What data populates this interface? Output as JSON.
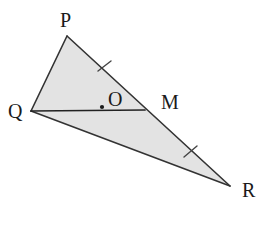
{
  "figure": {
    "kind": "geometry-diagram",
    "background_color": "#ffffff",
    "fill_color": "#e3e3e3",
    "stroke_color": "#333333",
    "label_color": "#1a1a1a",
    "canvas": {
      "width": 278,
      "height": 227
    }
  },
  "labels": {
    "p": "P",
    "q": "Q",
    "r": "R",
    "m": "M",
    "o": "O"
  },
  "points": {
    "P": {
      "x": 67,
      "y": 36
    },
    "Q": {
      "x": 31,
      "y": 111
    },
    "R": {
      "x": 230,
      "y": 186
    },
    "M": {
      "x": 145,
      "y": 110
    },
    "O": {
      "x": 102,
      "y": 107
    }
  },
  "segments": [
    {
      "name": "PQ",
      "from": "P",
      "to": "Q"
    },
    {
      "name": "PR",
      "from": "P",
      "to": "R"
    },
    {
      "name": "QR",
      "from": "Q",
      "to": "R"
    },
    {
      "name": "QM",
      "from": "Q",
      "to": "M"
    }
  ],
  "tick_marks": [
    {
      "name": "tick-PM",
      "on_segment": "PM",
      "x": 104,
      "y": 66,
      "count": 1
    },
    {
      "name": "tick-MR",
      "on_segment": "MR",
      "x": 190,
      "y": 151,
      "count": 1
    }
  ],
  "geometry_paths": {
    "triangle": "M 67,36 L 230,186 L 31,111 Z",
    "pq": "M 67,36 L 31,111",
    "pr": "M 67,36 L 230,186",
    "qr": "M 31,111 L 230,186",
    "qm": "M 31,111 L 145,110",
    "tick1": "M 98,71 L 111,61",
    "tick2": "M 184,157 L 197,146"
  }
}
